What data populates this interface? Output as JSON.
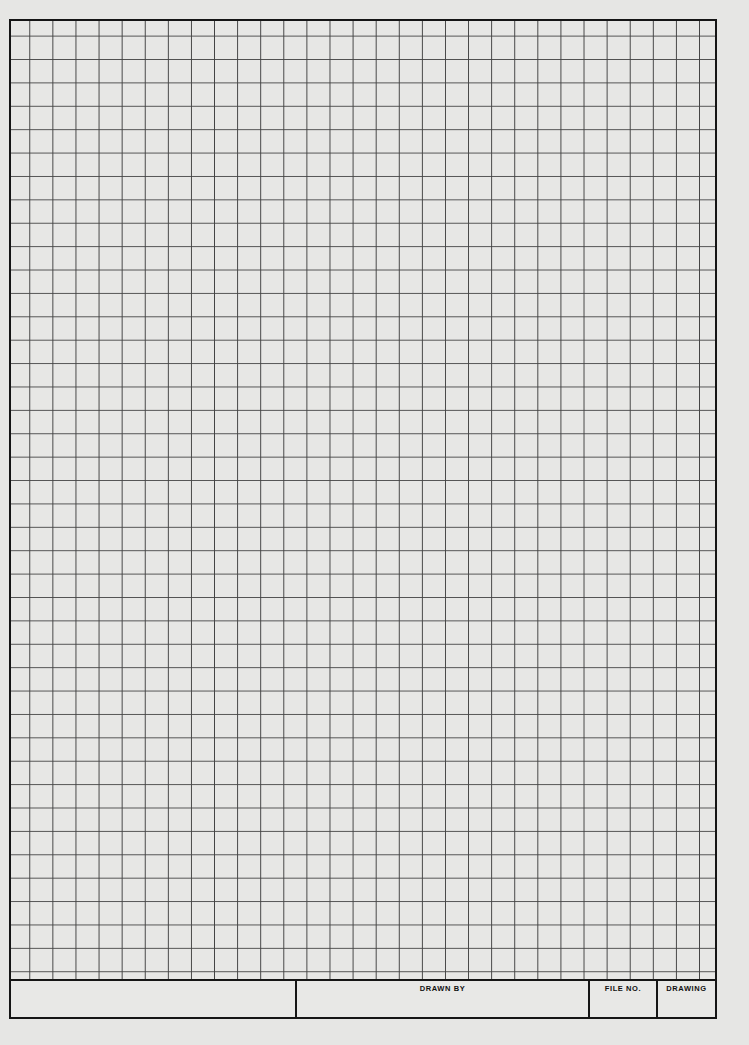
{
  "sheet": {
    "type": "engineering graph paper",
    "grid": {
      "columns": 30,
      "rows": 41,
      "line_color": "#3a3a3a",
      "paper_color": "#e8e8e6"
    },
    "border_color": "#151515"
  },
  "title_block": {
    "cells": [
      {
        "label": ""
      },
      {
        "label": "DRAWN BY"
      },
      {
        "label": "FILE NO."
      },
      {
        "label": "DRAWING"
      }
    ]
  }
}
